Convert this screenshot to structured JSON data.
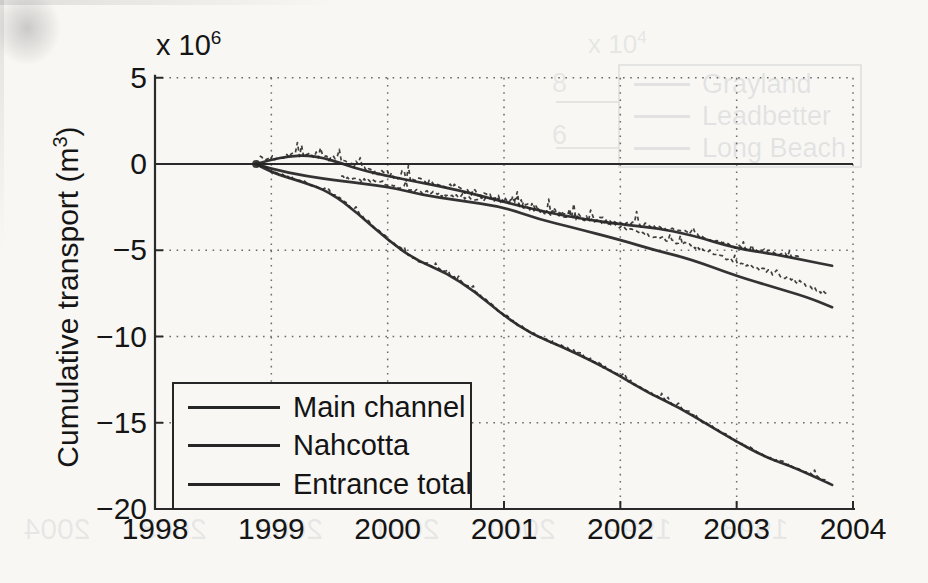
{
  "figure_kind": "scanned matlab cumulative transport figure",
  "axes": {
    "y_title": {
      "pre": "Cumulative transport (m",
      "sup": "3",
      "post": ")"
    },
    "y_scale": {
      "pre": "x 10",
      "sup": "6"
    },
    "y_ticks": [
      {
        "label": "5",
        "value": 5
      },
      {
        "label": "0",
        "value": 0
      },
      {
        "label": "−5",
        "value": -5
      },
      {
        "label": "−10",
        "value": -10
      },
      {
        "label": "−15",
        "value": -15
      },
      {
        "label": "−20",
        "value": -20
      }
    ],
    "x_ticks": [
      {
        "label": "1998",
        "value": 1998
      },
      {
        "label": "1999",
        "value": 1999
      },
      {
        "label": "2000",
        "value": 2000
      },
      {
        "label": "2001",
        "value": 2001
      },
      {
        "label": "2002",
        "value": 2002
      },
      {
        "label": "2003",
        "value": 2003
      },
      {
        "label": "2004",
        "value": 2004
      }
    ]
  },
  "legend": {
    "items": [
      "Main channel",
      "Nahcotta",
      "Entrance total"
    ]
  },
  "chart_data": {
    "type": "line",
    "title": "",
    "xlabel": "",
    "ylabel": "Cumulative transport (m³)",
    "y_scale_factor": "×10⁶",
    "xlim": [
      1998,
      2004
    ],
    "ylim": [
      -20,
      5
    ],
    "grid": "dotted",
    "zero_line": true,
    "legend_position": "lower-left",
    "series": [
      {
        "name": "Main channel",
        "x": [
          1998.87,
          1999.0,
          1999.15,
          1999.3,
          1999.45,
          1999.6,
          1999.75,
          2000.0,
          2000.3,
          2000.6,
          2001.0,
          2001.3,
          2001.6,
          2002.0,
          2002.3,
          2002.6,
          2003.0,
          2003.3,
          2003.6,
          2003.82
        ],
        "y": [
          0,
          0.25,
          0.45,
          0.5,
          0.35,
          0.05,
          -0.3,
          -0.7,
          -1.1,
          -1.5,
          -2.2,
          -2.7,
          -3.1,
          -3.5,
          -3.7,
          -4.1,
          -4.9,
          -5.2,
          -5.6,
          -5.9
        ]
      },
      {
        "name": "Nahcotta",
        "x": [
          1998.87,
          1999.0,
          1999.3,
          1999.6,
          2000.0,
          2000.3,
          2000.6,
          2001.0,
          2001.3,
          2001.6,
          2002.0,
          2002.3,
          2002.6,
          2003.0,
          2003.3,
          2003.6,
          2003.82
        ],
        "y": [
          0,
          -0.3,
          -0.7,
          -1.0,
          -1.3,
          -1.8,
          -2.1,
          -2.5,
          -3.2,
          -3.7,
          -4.4,
          -5.0,
          -5.5,
          -6.5,
          -7.1,
          -7.7,
          -8.3
        ]
      },
      {
        "name": "Entrance total",
        "x": [
          1998.87,
          1999.0,
          1999.25,
          1999.5,
          1999.75,
          2000.0,
          2000.25,
          2000.5,
          2000.75,
          2001.0,
          2001.25,
          2001.5,
          2001.75,
          2002.0,
          2002.25,
          2002.5,
          2002.75,
          2003.0,
          2003.25,
          2003.5,
          2003.82
        ],
        "y": [
          0,
          -0.5,
          -1.0,
          -1.6,
          -2.9,
          -4.4,
          -5.6,
          -6.3,
          -7.4,
          -8.8,
          -9.9,
          -10.6,
          -11.4,
          -12.3,
          -13.3,
          -14.1,
          -15.1,
          -16.1,
          -17.0,
          -17.6,
          -18.6
        ]
      }
    ],
    "measured_overlays": [
      {
        "follows": "Main channel",
        "style": "dash-dot scatter",
        "offset": 0.1,
        "amplitude": 0.22,
        "range": [
          1998.9,
          2003.55
        ]
      },
      {
        "follows": "Nahcotta",
        "style": "dash-dot scatter",
        "offset": 0.55,
        "amplitude": 0.14,
        "range": [
          1999.6,
          2003.78
        ]
      },
      {
        "follows": "Entrance total",
        "style": "dash-dot scatter",
        "offset": 0.05,
        "amplitude": 0.1,
        "range": [
          1998.9,
          2003.8
        ]
      }
    ]
  },
  "ghost": {
    "scale": {
      "pre": "x 10",
      "sup": "4"
    },
    "y_ticks": [
      "8",
      "6"
    ],
    "legend_items": [
      "Grayland",
      "Leadbetter",
      "Long Beach"
    ],
    "x_tick_row": [
      "1998",
      "1999",
      "2000",
      "2001",
      "2002",
      "2003",
      "2004"
    ]
  },
  "colors": {
    "paper": "#f8f7f4",
    "line": "#262626",
    "axis": "#2a2a2a",
    "grid": "#4a4a4a",
    "text": "#151515",
    "ghost": "#6c7482"
  }
}
